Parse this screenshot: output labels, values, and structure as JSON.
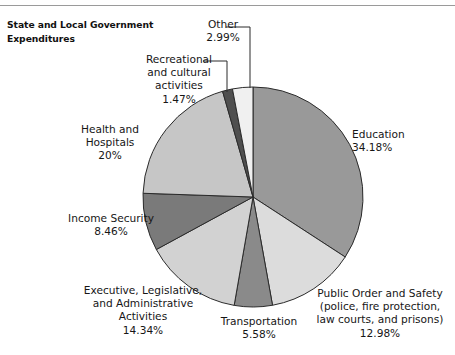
{
  "title": "State and Local Government\nExpenditures",
  "chart_data": {
    "type": "pie",
    "title": "State and Local Government Expenditures",
    "xlabel": "",
    "ylabel": "",
    "legend_position": "none",
    "grid": false,
    "units": "percent",
    "categories": [
      "Education",
      "Public Order and Safety (police, fire protection, law courts, and prisons)",
      "Transportation",
      "Executive, Legislative, and Administrative Activities",
      "Income Security",
      "Health and Hospitals",
      "Recreational and cultural activities",
      "Other"
    ],
    "values": [
      34.18,
      12.98,
      5.58,
      14.34,
      8.46,
      20.0,
      1.47,
      2.99
    ],
    "slices": [
      {
        "name": "education",
        "label": "Education",
        "value_text": "34.18%",
        "value": 34.18,
        "color": "#999999"
      },
      {
        "name": "public-order-and-safety",
        "label": "Public Order and Safety\n(police, fire protection,\nlaw courts, and prisons)",
        "value_text": "12.98%",
        "value": 12.98,
        "color": "#dcdcdc"
      },
      {
        "name": "transportation",
        "label": "Transportation",
        "value_text": "5.58%",
        "value": 5.58,
        "color": "#8a8a8a"
      },
      {
        "name": "executive-legislative-administrative",
        "label": "Executive, Legislative,\nand Administrative\nActivities",
        "value_text": "14.34%",
        "value": 14.34,
        "color": "#d2d2d2"
      },
      {
        "name": "income-security",
        "label": "Income Security",
        "value_text": "8.46%",
        "value": 8.46,
        "color": "#7a7a7a"
      },
      {
        "name": "health-and-hospitals",
        "label": "Health and\nHospitals",
        "value_text": "20%",
        "value": 20.0,
        "color": "#c6c6c6"
      },
      {
        "name": "recreational-and-cultural-activities",
        "label": "Recreational\nand cultural\nactivities",
        "value_text": "1.47%",
        "value": 1.47,
        "color": "#4f4f4f"
      },
      {
        "name": "other",
        "label": "Other",
        "value_text": "2.99%",
        "value": 2.99,
        "color": "#f0f0f0"
      }
    ],
    "geometry": {
      "center_x": 253,
      "center_y": 197,
      "radius": 110,
      "start_angle_deg": -90,
      "direction": "clockwise"
    },
    "colors": {
      "outline": "#2b2b2b",
      "background": "#ffffff",
      "text": "#161616",
      "leader_line": "#2b2b2b",
      "top_rule": "#9a9a9a"
    }
  },
  "labels": {
    "education": {
      "text": "Education\n34.18%"
    },
    "public_order": {
      "text": "Public Order and Safety\n(police, fire protection,\nlaw courts, and prisons)\n12.98%"
    },
    "transportation": {
      "text": "Transportation\n5.58%"
    },
    "executive": {
      "text": "Executive, Legislative,\nand Administrative\nActivities\n14.34%"
    },
    "income": {
      "text": "Income Security\n8.46%"
    },
    "health": {
      "text": "Health and\nHospitals\n20%"
    },
    "recreational": {
      "text": "Recreational\nand cultural\nactivities\n1.47%"
    },
    "other": {
      "text": "Other\n2.99%"
    }
  }
}
